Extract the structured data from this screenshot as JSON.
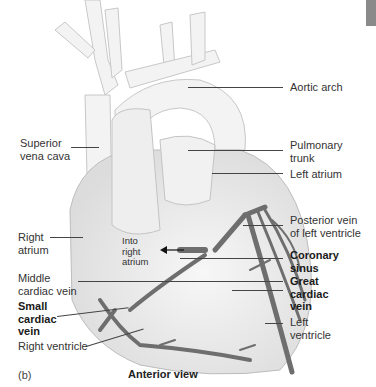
{
  "figure": {
    "panel_label": "(b)",
    "caption": "Anterior view",
    "tab_color": "#8a8a8a",
    "vein_color": "#6e6e6e",
    "heart_fill": "#ececec"
  },
  "labels": {
    "aortic_arch": [
      "Aortic arch"
    ],
    "superior_vena_cava": [
      "Superior",
      "vena cava"
    ],
    "pulmonary_trunk": [
      "Pulmonary",
      "trunk"
    ],
    "left_atrium": [
      "Left atrium"
    ],
    "posterior_vein": [
      "Posterior vein",
      "of left ventricle"
    ],
    "right_atrium": [
      "Right",
      "atrium"
    ],
    "into_right_atrium": [
      "Into",
      "right",
      "atrium"
    ],
    "coronary_sinus": [
      "Coronary",
      "sinus"
    ],
    "middle_cardiac_vein": [
      "Middle",
      "cardiac vein"
    ],
    "great_cardiac_vein": [
      "Great",
      "cardiac",
      "vein"
    ],
    "small_cardiac_vein": [
      "Small",
      "cardiac",
      "vein"
    ],
    "left_ventricle": [
      "Left",
      "ventricle"
    ],
    "right_ventricle": [
      "Right ventricle"
    ]
  }
}
